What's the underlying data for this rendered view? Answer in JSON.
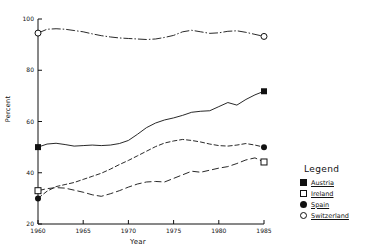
{
  "chart_data": {
    "type": "line",
    "title": "",
    "xlabel": "Year",
    "ylabel": "Percent",
    "xlim": [
      1960,
      1985
    ],
    "ylim": [
      20,
      100
    ],
    "xticks": [
      1960,
      1965,
      1970,
      1975,
      1980,
      1985
    ],
    "yticks": [
      20,
      40,
      60,
      80,
      100
    ],
    "xtick_labels": [
      "1960",
      "1965",
      "1970",
      "1975",
      "1980",
      "1985"
    ],
    "ytick_labels": [
      "20",
      "40",
      "60",
      "80",
      "100"
    ],
    "grid": false,
    "legend_position": "right",
    "x": [
      1960,
      1961,
      1962,
      1963,
      1964,
      1965,
      1966,
      1967,
      1968,
      1969,
      1970,
      1971,
      1972,
      1973,
      1974,
      1975,
      1976,
      1977,
      1978,
      1979,
      1980,
      1981,
      1982,
      1983,
      1984,
      1985
    ],
    "series": [
      {
        "name": "Switzerland",
        "marker": "circle-open",
        "dash": "dash-dot-dot",
        "endpoint_markers": [
          1960,
          1985
        ],
        "values": [
          94.5,
          96.0,
          96.2,
          96.0,
          95.5,
          95.0,
          94.2,
          93.5,
          93.0,
          92.6,
          92.4,
          92.2,
          92.0,
          92.2,
          92.8,
          93.6,
          95.0,
          95.6,
          95.0,
          94.4,
          94.6,
          95.2,
          95.4,
          94.8,
          94.0,
          93.2
        ]
      },
      {
        "name": "Austria",
        "marker": "square-filled",
        "dash": "solid",
        "endpoint_markers": [
          1960,
          1985
        ],
        "values": [
          50.0,
          51.2,
          51.5,
          51.0,
          50.4,
          50.6,
          50.8,
          50.6,
          50.8,
          51.4,
          52.6,
          55.0,
          57.6,
          59.4,
          60.6,
          61.4,
          62.4,
          63.6,
          64.0,
          64.2,
          65.8,
          67.4,
          66.4,
          68.6,
          70.4,
          71.8
        ]
      },
      {
        "name": "Spain",
        "marker": "circle-filled",
        "dash": "dash-dot",
        "endpoint_markers": [
          1960,
          1985
        ],
        "values": [
          30.0,
          32.8,
          34.6,
          35.4,
          36.2,
          37.4,
          38.6,
          39.8,
          41.4,
          43.2,
          44.8,
          46.6,
          48.4,
          50.2,
          51.6,
          52.4,
          53.0,
          52.6,
          52.0,
          51.2,
          50.6,
          50.4,
          50.8,
          51.4,
          50.8,
          50.0
        ]
      },
      {
        "name": "Ireland",
        "marker": "square-open",
        "dash": "long-dash",
        "endpoint_markers": [
          1960,
          1985
        ],
        "values": [
          33.0,
          33.8,
          34.2,
          34.0,
          33.2,
          32.4,
          31.4,
          30.8,
          31.8,
          33.0,
          34.4,
          35.6,
          36.4,
          36.6,
          36.4,
          37.8,
          39.2,
          40.6,
          40.2,
          41.0,
          41.8,
          42.4,
          43.6,
          45.0,
          45.8,
          44.2
        ]
      }
    ]
  },
  "legend": {
    "title": "Legend",
    "items": [
      {
        "label": "Austria",
        "symbol": "square-filled-icon"
      },
      {
        "label": "Ireland",
        "symbol": "square-open-icon"
      },
      {
        "label": "Spain",
        "symbol": "circle-filled-icon"
      },
      {
        "label": "Switzerland",
        "symbol": "circle-open-icon"
      }
    ]
  }
}
